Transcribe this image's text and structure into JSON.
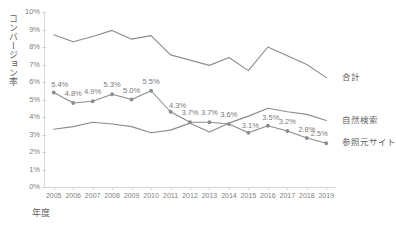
{
  "chart_data": {
    "type": "line",
    "title": "",
    "xlabel": "年度",
    "ylabel": "コンバージョン率",
    "ylim": [
      0,
      10
    ],
    "ytick_labels": [
      "0%",
      "1%",
      "2%",
      "3%",
      "4%",
      "5%",
      "6%",
      "7%",
      "8%",
      "9%",
      "10%"
    ],
    "ytick_values": [
      0,
      1,
      2,
      3,
      4,
      5,
      6,
      7,
      8,
      9,
      10
    ],
    "grid": false,
    "legend_position": "right-inline",
    "categories": [
      "2005",
      "2006",
      "2007",
      "2008",
      "2009",
      "2010",
      "2011",
      "2012",
      "2013",
      "2014",
      "2015",
      "2016",
      "2017",
      "2018",
      "2019"
    ],
    "series": [
      {
        "name": "合計",
        "color": "#8c8c8c",
        "markers": false,
        "labels_shown": false,
        "values": [
          8.7,
          8.3,
          8.6,
          8.95,
          8.45,
          8.65,
          7.55,
          7.25,
          6.95,
          7.4,
          6.65,
          8.0,
          7.5,
          7.0,
          6.25
        ]
      },
      {
        "name": "自然検索",
        "color": "#8c8c8c",
        "markers": false,
        "labels_shown": false,
        "values": [
          3.3,
          3.45,
          3.7,
          3.6,
          3.45,
          3.1,
          3.25,
          3.65,
          3.15,
          3.65,
          4.05,
          4.5,
          4.3,
          4.15,
          3.8
        ]
      },
      {
        "name": "参照元サイト",
        "color": "#8c8c8c",
        "markers": true,
        "labels_shown": true,
        "values": [
          5.4,
          4.8,
          4.9,
          5.3,
          5.0,
          5.5,
          4.3,
          3.7,
          3.7,
          3.6,
          3.1,
          3.5,
          3.2,
          2.8,
          2.5
        ],
        "labels": [
          "5.4%",
          "4.8%",
          "4.9%",
          "5.3%",
          "5.0%",
          "5.5%",
          "4.3%",
          "3.7%",
          "3.7%",
          "3.6%",
          "3.1%",
          "3.5%",
          "3.2%",
          "2.8%",
          "2.5%"
        ]
      }
    ]
  }
}
